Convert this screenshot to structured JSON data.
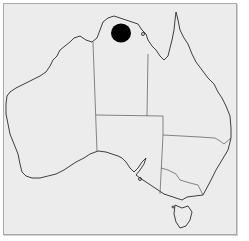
{
  "map": {
    "region": "Australia",
    "states": [
      "Western Australia",
      "Northern Territory",
      "South Australia",
      "Queensland",
      "New South Wales",
      "Victoria",
      "Tasmania"
    ],
    "colors": {
      "background": "#ececec",
      "frame_border": "#a8a8a8",
      "coastline": "#2a2a2a",
      "state_border": "#555555",
      "marker": "#000000"
    },
    "markers": [
      {
        "label": "distribution",
        "region": "Northern Territory (Arnhem Land)",
        "cx": 121,
        "cy": 33,
        "r": 10
      }
    ]
  }
}
